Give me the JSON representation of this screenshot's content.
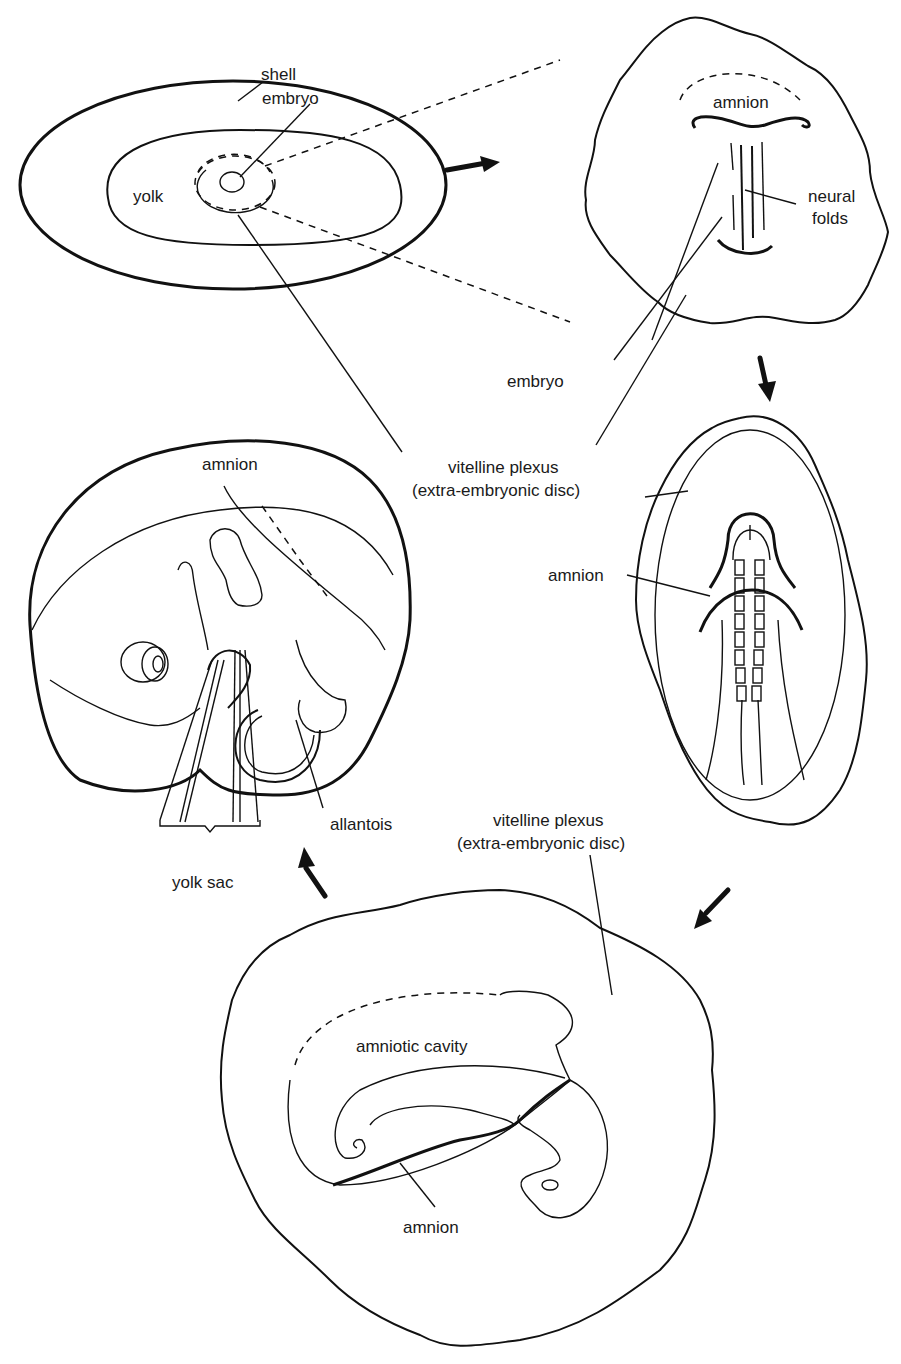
{
  "figure": {
    "stages": [
      {
        "id": "egg-overview",
        "labels": {
          "shell": "shell",
          "embryo": "embryo",
          "yolk": "yolk"
        }
      },
      {
        "id": "early-embryo-disc",
        "labels": {
          "amnion": "amnion",
          "neural_folds_1": "neural",
          "neural_folds_2": "folds"
        }
      },
      {
        "id": "somite-stage",
        "labels": {
          "amnion": "amnion"
        }
      },
      {
        "id": "amniotic-fold-stage",
        "labels": {
          "amniotic_cavity": "amniotic cavity",
          "amnion": "amnion"
        }
      },
      {
        "id": "late-embryo",
        "labels": {
          "amnion": "amnion",
          "allantois": "allantois",
          "yolk_sac": "yolk sac"
        }
      }
    ],
    "shared_labels": {
      "embryo": "embryo",
      "vitelline_1_line1": "vitelline plexus",
      "vitelline_1_line2": "(extra-embryonic disc)",
      "vitelline_2_line1": "vitelline plexus",
      "vitelline_2_line2": "(extra-embryonic disc)"
    },
    "arrows": [
      "right",
      "down",
      "down-left",
      "up-left"
    ],
    "colors": {
      "line": "#111111",
      "background": "#ffffff",
      "text": "#1a1a1a"
    }
  }
}
